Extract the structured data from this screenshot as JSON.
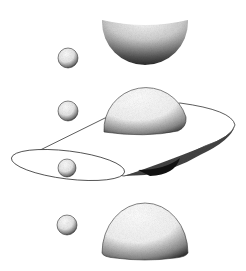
{
  "illustration": {
    "subject": "stippled spheres, domes and a disc shape",
    "colors": {
      "background": "#ffffff",
      "ink": "#1a1a1a",
      "shade": "#555555"
    },
    "elements": [
      {
        "name": "large-hemisphere-top",
        "cx": 145,
        "cy": 20,
        "r": 43
      },
      {
        "name": "small-sphere-1",
        "cx": 68,
        "cy": 58,
        "r": 10
      },
      {
        "name": "small-sphere-2",
        "cx": 68,
        "cy": 111,
        "r": 10
      },
      {
        "name": "dome-on-disc",
        "cx": 145,
        "cy": 131,
        "r": 40
      },
      {
        "name": "small-sphere-3",
        "cx": 67,
        "cy": 168,
        "r": 9
      },
      {
        "name": "small-sphere-4",
        "cx": 67,
        "cy": 225,
        "r": 10
      },
      {
        "name": "dome-bottom",
        "cx": 145,
        "cy": 250,
        "r": 43
      }
    ]
  }
}
